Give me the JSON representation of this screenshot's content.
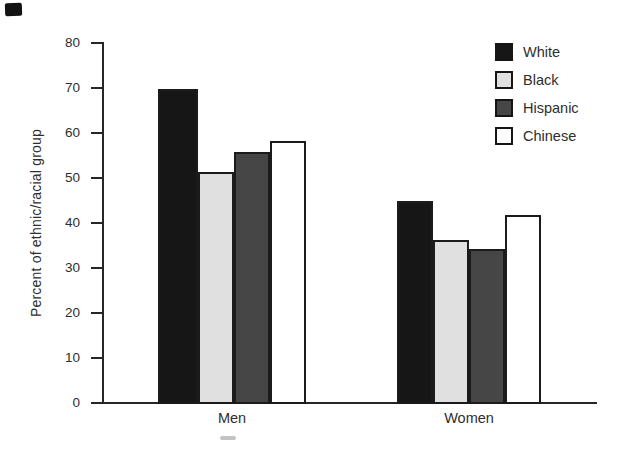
{
  "chart_data": {
    "type": "bar",
    "title": "",
    "categories": [
      "Men",
      "Women"
    ],
    "series": [
      {
        "name": "White",
        "color": "#161616",
        "values": [
          70,
          45
        ]
      },
      {
        "name": "Black",
        "color": "#e0e0e0",
        "values": [
          51.5,
          36.5
        ]
      },
      {
        "name": "Hispanic",
        "color": "#464646",
        "values": [
          56,
          34.5
        ]
      },
      {
        "name": "Chinese",
        "color": "#ffffff",
        "values": [
          58.5,
          42
        ]
      }
    ],
    "xlabel": "",
    "ylabel": "Percent of ethnic/racial group",
    "ylim": [
      0,
      80
    ],
    "yticks": [
      0,
      10,
      20,
      30,
      40,
      50,
      60,
      70,
      80
    ],
    "grid": false,
    "legend_position": "top-right",
    "bar_border_color": "#1b1b1b",
    "axis_color": "#262626",
    "text_color": "#2e2e2e",
    "background_color": "#ffffff"
  }
}
